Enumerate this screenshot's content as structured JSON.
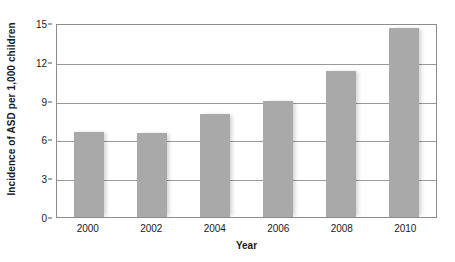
{
  "chart_data": {
    "type": "bar",
    "title": "",
    "subtitle": "",
    "xlabel": "Year",
    "ylabel": "Incidence of ASD per 1,000 children",
    "categories": [
      "2000",
      "2002",
      "2004",
      "2006",
      "2008",
      "2010"
    ],
    "values": [
      6.6,
      6.5,
      8.0,
      9.0,
      11.3,
      14.6
    ],
    "series": [
      {
        "name": "Incidence of ASD",
        "values": [
          6.6,
          6.5,
          8.0,
          9.0,
          11.3,
          14.6
        ]
      }
    ],
    "ylim": [
      0,
      15
    ],
    "yticks": [
      0,
      3,
      6,
      9,
      12,
      15
    ],
    "ytick_labels": [
      "0",
      "3",
      "6",
      "9",
      "12",
      "15"
    ],
    "xtick_labels": [
      "2000",
      "2002",
      "2004",
      "2006",
      "2008",
      "2010"
    ],
    "grid": true,
    "grid_axis": "y",
    "legend": false,
    "legend_position": "none",
    "bar_color": "#a9a9a9",
    "grid_color": "#9a9a9a",
    "axis_color": "#8c8c8c",
    "text_color": "#1a1a1a",
    "background_color": "#ffffff",
    "annotations": []
  }
}
